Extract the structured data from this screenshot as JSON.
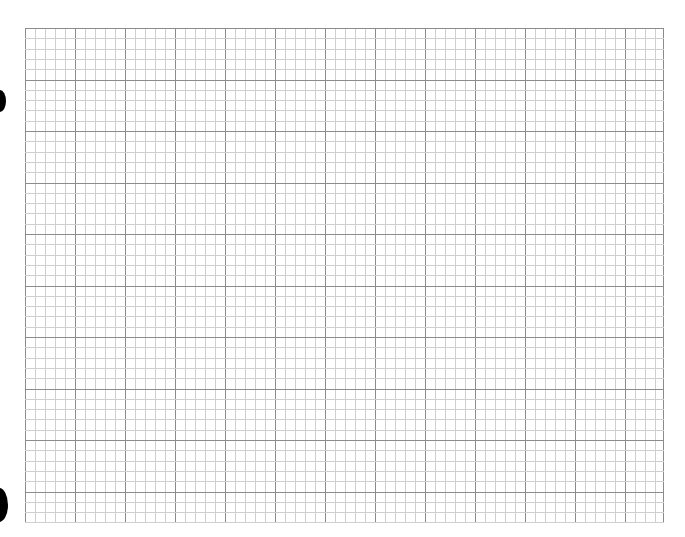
{
  "sheet": {
    "type": "graph-paper",
    "grid": {
      "left": 25,
      "top": 28,
      "width": 639,
      "height": 494,
      "major_spacing_x": 50,
      "major_spacing_y": 51.5,
      "minor_divisions": 5,
      "major_color": "#8c8c8c",
      "minor_color": "#cfcfcf",
      "background": "#ffffff"
    },
    "punch_holes": [
      {
        "x": -6,
        "y": 90,
        "w": 12,
        "h": 22
      },
      {
        "x": -10,
        "y": 488,
        "w": 18,
        "h": 34
      }
    ]
  }
}
